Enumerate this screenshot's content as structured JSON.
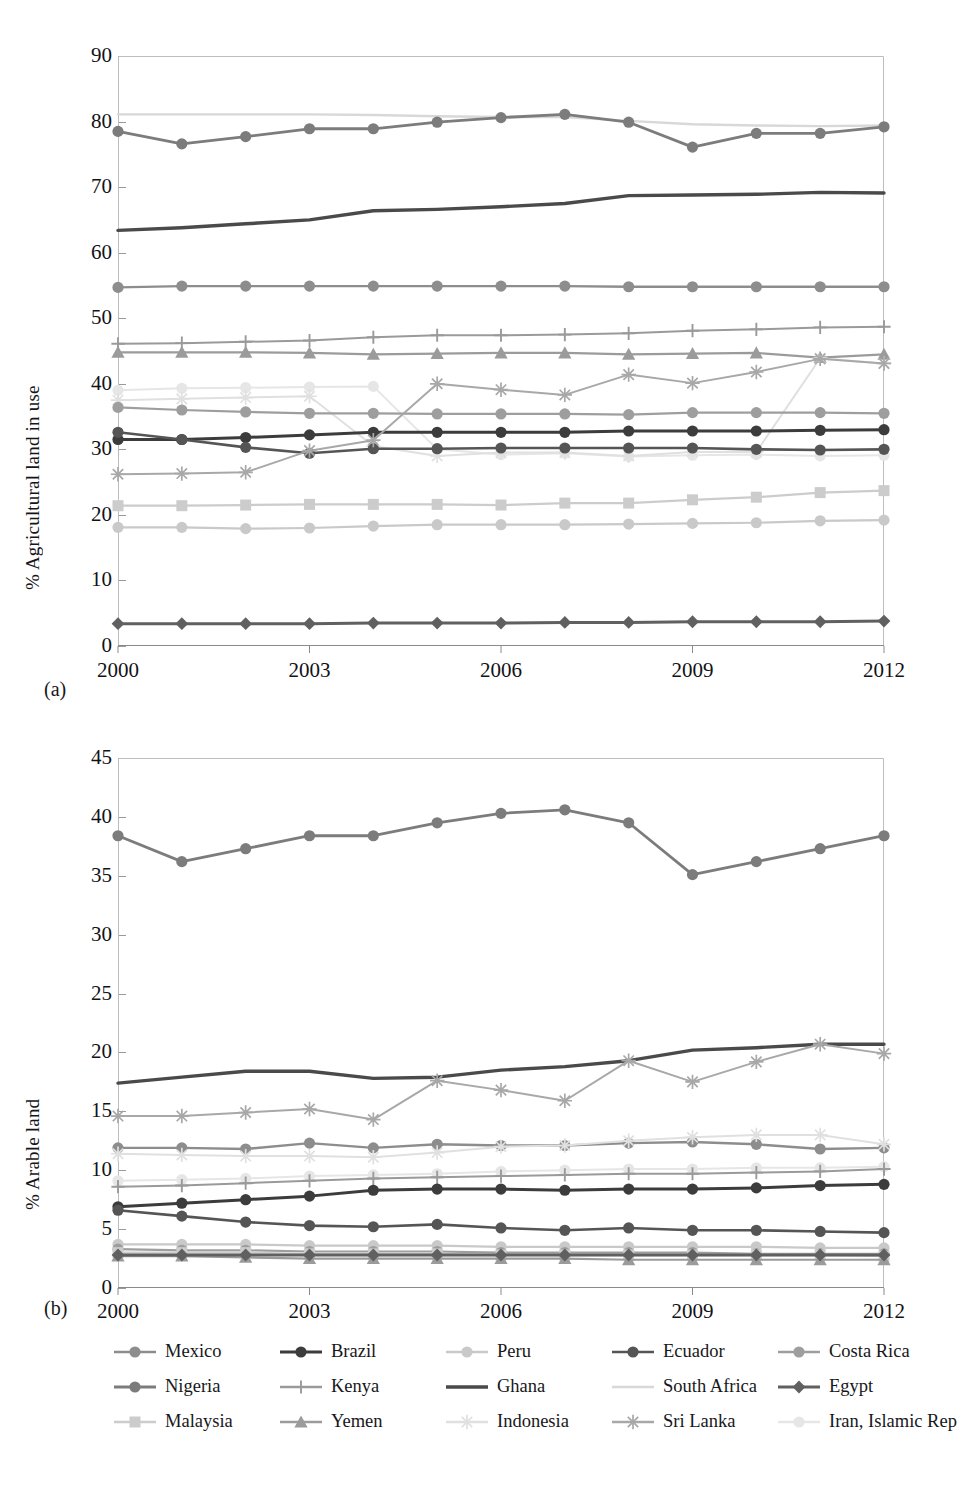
{
  "figure": {
    "panel_a_label": "(a)",
    "panel_b_label": "(b)"
  },
  "panel_a": {
    "ylabel": "% Agricultural land in use",
    "yticks": [
      "0",
      "10",
      "20",
      "30",
      "40",
      "50",
      "60",
      "70",
      "80",
      "90"
    ],
    "xticks": [
      "2000",
      "2003",
      "2006",
      "2009",
      "2012"
    ]
  },
  "panel_b": {
    "ylabel": "% Arable land",
    "yticks": [
      "0",
      "5",
      "10",
      "15",
      "20",
      "25",
      "30",
      "35",
      "40",
      "45"
    ],
    "xticks": [
      "2000",
      "2003",
      "2006",
      "2009",
      "2012"
    ]
  },
  "legend": {
    "rows": [
      [
        {
          "label": "Mexico",
          "color": "#8d8d8d",
          "marker": "circle",
          "width": 2.4
        },
        {
          "label": "Brazil",
          "color": "#3c3c3c",
          "marker": "circle",
          "width": 3.0
        },
        {
          "label": "Peru",
          "color": "#c9c9c9",
          "marker": "circle",
          "width": 2.2
        },
        {
          "label": "Ecuador",
          "color": "#555555",
          "marker": "circle",
          "width": 2.6
        },
        {
          "label": "Costa Rica",
          "color": "#9e9e9e",
          "marker": "circle",
          "width": 2.2
        }
      ],
      [
        {
          "label": "Nigeria",
          "color": "#7c7c7c",
          "marker": "circle",
          "width": 2.8
        },
        {
          "label": "Kenya",
          "color": "#9a9a9a",
          "marker": "plus",
          "width": 2.0
        },
        {
          "label": "Ghana",
          "color": "#4a4a4a",
          "marker": "none",
          "width": 3.4
        },
        {
          "label": "South Africa",
          "color": "#d8d8d8",
          "marker": "none",
          "width": 2.4
        },
        {
          "label": "Egypt",
          "color": "#606060",
          "marker": "diamond",
          "width": 3.0
        }
      ],
      [
        {
          "label": "Malaysia",
          "color": "#cccccc",
          "marker": "square",
          "width": 2.2
        },
        {
          "label": "Yemen",
          "color": "#9b9b9b",
          "marker": "triangle",
          "width": 2.2
        },
        {
          "label": "Indonesia",
          "color": "#e0e0e0",
          "marker": "asterisk",
          "width": 2.0
        },
        {
          "label": "Sri Lanka",
          "color": "#a8a8a8",
          "marker": "asterisk",
          "width": 2.0
        },
        {
          "label": "Iran, Islamic Rep",
          "color": "#e6e6e6",
          "marker": "circle",
          "width": 2.0
        }
      ]
    ]
  },
  "chart_data": [
    {
      "type": "line",
      "panel": "(a)",
      "title": "",
      "xlabel": "",
      "ylabel": "% Agricultural land in use",
      "x": [
        2000,
        2001,
        2002,
        2003,
        2004,
        2005,
        2006,
        2007,
        2008,
        2009,
        2010,
        2011,
        2012
      ],
      "xlim": [
        2000,
        2012
      ],
      "ylim": [
        0,
        90
      ],
      "yticks": [
        0,
        10,
        20,
        30,
        40,
        50,
        60,
        70,
        80,
        90
      ],
      "xticks": [
        2000,
        2003,
        2006,
        2009,
        2012
      ],
      "grid": false,
      "legend_position": "bottom",
      "series": [
        {
          "name": "South Africa",
          "values": [
            81.1,
            81.1,
            81.1,
            81.1,
            81.0,
            80.8,
            80.7,
            80.7,
            80.1,
            79.6,
            79.4,
            79.3,
            79.4
          ]
        },
        {
          "name": "Nigeria",
          "values": [
            78.5,
            76.6,
            77.7,
            78.9,
            78.9,
            79.9,
            80.6,
            81.1,
            79.9,
            76.1,
            78.2,
            78.2,
            79.2
          ]
        },
        {
          "name": "Ghana",
          "values": [
            63.4,
            63.8,
            64.4,
            65.0,
            66.4,
            66.6,
            67.0,
            67.5,
            68.7,
            68.8,
            68.9,
            69.2,
            69.1
          ]
        },
        {
          "name": "Mexico",
          "values": [
            54.7,
            54.9,
            54.9,
            54.9,
            54.9,
            54.9,
            54.9,
            54.9,
            54.8,
            54.8,
            54.8,
            54.8,
            54.8
          ]
        },
        {
          "name": "Kenya",
          "values": [
            46.1,
            46.2,
            46.4,
            46.6,
            47.1,
            47.4,
            47.4,
            47.5,
            47.7,
            48.1,
            48.3,
            48.6,
            48.7
          ]
        },
        {
          "name": "Yemen",
          "values": [
            44.8,
            44.8,
            44.8,
            44.7,
            44.5,
            44.6,
            44.7,
            44.7,
            44.5,
            44.6,
            44.7,
            44.0,
            44.5
          ]
        },
        {
          "name": "Iran, Islamic Rep",
          "values": [
            39.0,
            39.3,
            39.4,
            39.5,
            39.6,
            30.0,
            29.2,
            29.4,
            28.9,
            29.1,
            29.2,
            29.0,
            29.1
          ]
        },
        {
          "name": "Indonesia",
          "values": [
            37.5,
            37.7,
            37.9,
            38.1,
            30.5,
            29.0,
            29.5,
            29.5,
            29.0,
            29.6,
            29.6,
            43.9,
            43.1
          ]
        },
        {
          "name": "Costa Rica",
          "values": [
            36.4,
            36.0,
            35.7,
            35.5,
            35.5,
            35.4,
            35.4,
            35.4,
            35.3,
            35.6,
            35.6,
            35.6,
            35.5
          ]
        },
        {
          "name": "Brazil",
          "values": [
            31.5,
            31.5,
            31.8,
            32.2,
            32.6,
            32.6,
            32.6,
            32.6,
            32.8,
            32.8,
            32.8,
            32.9,
            33.0
          ]
        },
        {
          "name": "Ecuador",
          "values": [
            32.6,
            31.5,
            30.3,
            29.4,
            30.1,
            30.1,
            30.2,
            30.2,
            30.2,
            30.2,
            30.0,
            29.9,
            30.0
          ]
        },
        {
          "name": "Sri Lanka",
          "values": [
            26.2,
            26.3,
            26.5,
            29.8,
            31.4,
            40.0,
            39.1,
            38.3,
            41.4,
            40.1,
            41.8,
            43.8,
            43.1
          ]
        },
        {
          "name": "Malaysia",
          "values": [
            21.4,
            21.4,
            21.5,
            21.6,
            21.6,
            21.6,
            21.5,
            21.8,
            21.8,
            22.3,
            22.7,
            23.4,
            23.7
          ]
        },
        {
          "name": "Peru",
          "values": [
            18.1,
            18.1,
            17.9,
            18.0,
            18.3,
            18.5,
            18.5,
            18.5,
            18.6,
            18.7,
            18.8,
            19.1,
            19.2
          ]
        },
        {
          "name": "Egypt",
          "values": [
            3.4,
            3.4,
            3.4,
            3.4,
            3.5,
            3.5,
            3.5,
            3.6,
            3.6,
            3.7,
            3.7,
            3.7,
            3.8
          ]
        }
      ]
    },
    {
      "type": "line",
      "panel": "(b)",
      "title": "",
      "xlabel": "",
      "ylabel": "% Arable land",
      "x": [
        2000,
        2001,
        2002,
        2003,
        2004,
        2005,
        2006,
        2007,
        2008,
        2009,
        2010,
        2011,
        2012
      ],
      "xlim": [
        2000,
        2012
      ],
      "ylim": [
        0,
        45
      ],
      "yticks": [
        0,
        5,
        10,
        15,
        20,
        25,
        30,
        35,
        40,
        45
      ],
      "xticks": [
        2000,
        2003,
        2006,
        2009,
        2012
      ],
      "grid": false,
      "legend_position": "bottom",
      "series": [
        {
          "name": "Nigeria",
          "values": [
            38.4,
            36.2,
            37.3,
            38.4,
            38.4,
            39.5,
            40.3,
            40.6,
            39.5,
            35.1,
            36.2,
            37.3,
            38.4
          ]
        },
        {
          "name": "Ghana",
          "values": [
            17.4,
            17.9,
            18.4,
            18.4,
            17.8,
            17.9,
            18.5,
            18.8,
            19.3,
            20.2,
            20.4,
            20.7,
            20.7
          ]
        },
        {
          "name": "Sri Lanka",
          "values": [
            14.6,
            14.6,
            14.9,
            15.2,
            14.3,
            17.6,
            16.8,
            15.9,
            19.3,
            17.5,
            19.2,
            20.7,
            19.9
          ]
        },
        {
          "name": "Mexico",
          "values": [
            11.9,
            11.9,
            11.8,
            12.3,
            11.9,
            12.2,
            12.1,
            12.1,
            12.3,
            12.4,
            12.2,
            11.8,
            11.9
          ]
        },
        {
          "name": "Indonesia",
          "values": [
            11.4,
            11.3,
            11.2,
            11.2,
            11.1,
            11.5,
            12.0,
            12.1,
            12.5,
            12.8,
            13.0,
            13.0,
            12.2
          ]
        },
        {
          "name": "Iran, Islamic Rep",
          "values": [
            9.1,
            9.2,
            9.3,
            9.5,
            9.6,
            9.7,
            9.9,
            10.0,
            10.1,
            10.1,
            10.2,
            10.2,
            10.3
          ]
        },
        {
          "name": "Kenya",
          "values": [
            8.6,
            8.7,
            8.9,
            9.1,
            9.3,
            9.4,
            9.5,
            9.6,
            9.7,
            9.7,
            9.8,
            9.9,
            10.1
          ]
        },
        {
          "name": "Brazil",
          "values": [
            6.9,
            7.2,
            7.5,
            7.8,
            8.3,
            8.4,
            8.4,
            8.3,
            8.4,
            8.4,
            8.5,
            8.7,
            8.8
          ]
        },
        {
          "name": "Ecuador",
          "values": [
            6.6,
            6.1,
            5.6,
            5.3,
            5.2,
            5.4,
            5.1,
            4.9,
            5.1,
            4.9,
            4.9,
            4.8,
            4.7
          ]
        },
        {
          "name": "Peru",
          "values": [
            3.7,
            3.7,
            3.7,
            3.6,
            3.6,
            3.6,
            3.5,
            3.5,
            3.5,
            3.5,
            3.5,
            3.4,
            3.4
          ]
        },
        {
          "name": "Costa Rica",
          "values": [
            3.3,
            3.2,
            3.2,
            3.1,
            3.1,
            3.1,
            3.0,
            3.0,
            3.0,
            3.0,
            2.9,
            2.9,
            2.9
          ]
        },
        {
          "name": "Malaysia",
          "values": [
            3.0,
            3.0,
            3.0,
            2.9,
            2.9,
            2.9,
            2.8,
            2.8,
            2.8,
            2.8,
            2.8,
            2.8,
            2.7
          ]
        },
        {
          "name": "South Africa",
          "values": [
            2.9,
            2.9,
            2.9,
            2.8,
            2.8,
            2.8,
            2.8,
            2.8,
            2.8,
            2.8,
            2.8,
            2.8,
            2.8
          ]
        },
        {
          "name": "Yemen",
          "values": [
            2.7,
            2.7,
            2.6,
            2.5,
            2.5,
            2.5,
            2.5,
            2.5,
            2.4,
            2.4,
            2.4,
            2.4,
            2.4
          ]
        },
        {
          "name": "Egypt",
          "values": [
            2.8,
            2.8,
            2.8,
            2.8,
            2.8,
            2.8,
            2.8,
            2.8,
            2.8,
            2.8,
            2.8,
            2.8,
            2.8
          ]
        }
      ]
    }
  ]
}
